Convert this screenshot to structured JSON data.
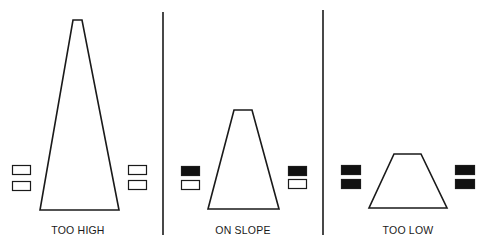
{
  "colors": {
    "stroke": "#1a1a1a",
    "light_on": "#111111",
    "light_off": "#ffffff",
    "background": "#ffffff"
  },
  "panels": [
    {
      "label": "TOO HIGH",
      "runway": {
        "top": [
          [
            73,
            20
          ],
          [
            82,
            20
          ]
        ],
        "bottom": [
          [
            40,
            210
          ],
          [
            119,
            210
          ]
        ]
      },
      "lights_left": [
        {
          "x": 12,
          "y": 165,
          "w": 18,
          "h": 9,
          "state": "white"
        },
        {
          "x": 12,
          "y": 181,
          "w": 18,
          "h": 9,
          "state": "white"
        }
      ],
      "lights_right": [
        {
          "x": 128,
          "y": 165,
          "w": 18,
          "h": 9,
          "state": "white"
        },
        {
          "x": 128,
          "y": 180,
          "w": 18,
          "h": 9,
          "state": "white"
        }
      ],
      "label_x": 18
    },
    {
      "label": "ON SLOPE",
      "runway": {
        "top": [
          [
            234,
            110
          ],
          [
            252,
            110
          ]
        ],
        "bottom": [
          [
            208,
            209
          ],
          [
            279,
            209
          ]
        ]
      },
      "lights_left": [
        {
          "x": 181,
          "y": 166,
          "w": 18,
          "h": 9,
          "state": "red"
        },
        {
          "x": 181,
          "y": 180,
          "w": 18,
          "h": 9,
          "state": "white"
        }
      ],
      "lights_right": [
        {
          "x": 288,
          "y": 166,
          "w": 18,
          "h": 9,
          "state": "red"
        },
        {
          "x": 288,
          "y": 179,
          "w": 18,
          "h": 9,
          "state": "white"
        }
      ],
      "label_x": 183
    },
    {
      "label": "TOO LOW",
      "runway": {
        "top": [
          [
            394,
            154
          ],
          [
            421,
            154
          ]
        ],
        "bottom": [
          [
            369,
            208
          ],
          [
            447,
            208
          ]
        ]
      },
      "lights_left": [
        {
          "x": 341,
          "y": 165,
          "w": 19,
          "h": 9,
          "state": "red"
        },
        {
          "x": 341,
          "y": 179,
          "w": 19,
          "h": 9,
          "state": "red"
        }
      ],
      "lights_right": [
        {
          "x": 455,
          "y": 165,
          "w": 19,
          "h": 9,
          "state": "red"
        },
        {
          "x": 455,
          "y": 179,
          "w": 19,
          "h": 9,
          "state": "red"
        }
      ],
      "label_x": 348
    }
  ],
  "dividers": [
    {
      "x": 163,
      "y1": 12,
      "y2": 235
    },
    {
      "x": 323,
      "y1": 10,
      "y2": 235
    }
  ]
}
